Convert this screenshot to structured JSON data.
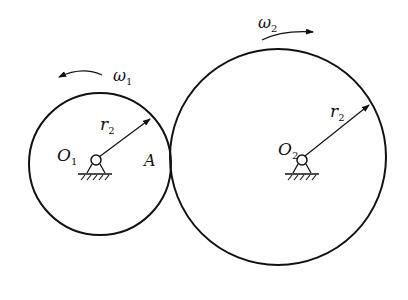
{
  "diagram": {
    "type": "friction wheel transmission (two contacting circles)",
    "stroke_color": "#111111",
    "background": "#ffffff",
    "wheel1": {
      "center_label": "O",
      "center_sub": "1",
      "radius_label": "r",
      "radius_sub": "2",
      "omega_label": "ω",
      "omega_sub": "1",
      "rotation": "counterclockwise"
    },
    "wheel2": {
      "center_label": "O",
      "center_sub": "2",
      "radius_label": "r",
      "radius_sub": "2",
      "omega_label": "ω",
      "omega_sub": "2",
      "rotation": "clockwise"
    },
    "contact_point_label": "A"
  }
}
